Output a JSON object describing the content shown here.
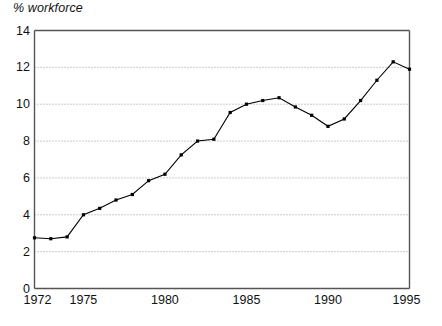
{
  "chart_data": {
    "type": "line",
    "title": "",
    "xlabel": "",
    "ylabel": "% workforce",
    "ylim": [
      0,
      14
    ],
    "xlim": [
      1972,
      1995
    ],
    "ytick_labels": [
      "0",
      "2",
      "4",
      "6",
      "8",
      "10",
      "12",
      "14"
    ],
    "ytick_values": [
      0,
      2,
      4,
      6,
      8,
      10,
      12,
      14
    ],
    "xtick_labels": [
      "1972",
      "1975",
      "1980",
      "1985",
      "1990",
      "1995"
    ],
    "xtick_values": [
      1972,
      1975,
      1980,
      1985,
      1990,
      1995
    ],
    "grid": "horizontal-dotted",
    "legend": "none",
    "marker": "square",
    "line_color": "#000000",
    "grid_color": "#999999",
    "axis_color": "#555555",
    "x": [
      1972,
      1973,
      1974,
      1975,
      1976,
      1977,
      1978,
      1979,
      1980,
      1981,
      1982,
      1983,
      1984,
      1985,
      1986,
      1987,
      1988,
      1989,
      1990,
      1991,
      1992,
      1993,
      1994,
      1995
    ],
    "values": [
      2.75,
      2.7,
      2.8,
      4.0,
      4.35,
      4.8,
      5.1,
      5.85,
      6.2,
      7.25,
      8.0,
      8.1,
      9.55,
      10.0,
      10.2,
      10.35,
      9.85,
      9.4,
      8.8,
      9.2,
      10.2,
      11.3,
      12.3,
      11.9
    ]
  }
}
